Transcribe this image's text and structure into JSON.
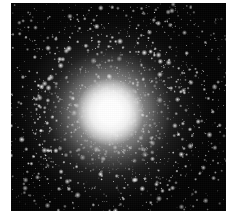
{
  "image": {
    "title": "Globular star cluster",
    "subject": "globular-cluster",
    "medium": "grayscale astronomical photograph",
    "caption": "",
    "plate": {
      "left_px": 11,
      "top_px": 3,
      "width_px": 215,
      "height_px": 208,
      "background_color": "#050505",
      "border": "none"
    },
    "page": {
      "width_px": 226,
      "height_px": 221,
      "background_color": "#ffffff"
    },
    "colors": {
      "page_background": "#ffffff",
      "sky_background": "#050505",
      "star_white": "#ffffff",
      "core_saturated": "#ffffff",
      "halo_mid_gray": "#b4b4b4",
      "faint_star_gray": "#787878"
    },
    "cluster": {
      "core_center_x_px": 110,
      "core_center_y_px": 112,
      "saturated_core_radius_px": 32,
      "bright_halo_radius_px": 62,
      "faint_halo_radius_px": 104,
      "appearance": "dense spherical concentration of stars, saturated white unresolved core fading smoothly outward into thousands of resolved point-source stars on a black sky",
      "resolved_stars_visible": true,
      "brightest_field_stars": "scattered large white points concentrated in the middle and outer halo",
      "corner_sky": "near-black with sparse faint stars"
    },
    "annotations": [],
    "axis_labels": [],
    "legend": []
  }
}
